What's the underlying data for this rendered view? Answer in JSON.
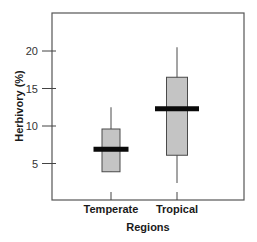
{
  "chart_data": {
    "type": "box",
    "title": "",
    "xlabel": "Regions",
    "ylabel": "Herbivory (%)",
    "categories": [
      "Temperate",
      "Tropical"
    ],
    "yticks": [
      5,
      10,
      15,
      20
    ],
    "ylim": [
      0,
      25.5
    ],
    "grid": false,
    "legend": null,
    "boxes": [
      {
        "category": "Temperate",
        "whisker_low": 3.9,
        "q1": 3.9,
        "median": 6.9,
        "q3": 9.6,
        "whisker_high": 12.5
      },
      {
        "category": "Tropical",
        "whisker_low": 2.4,
        "q1": 6.1,
        "median": 12.3,
        "q3": 16.5,
        "whisker_high": 20.5
      }
    ]
  },
  "style": {
    "box_fill": "#c4c4c4",
    "box_stroke": "#4a4a4a",
    "median_color": "#0a0a0a",
    "frame_color": "#555555"
  }
}
